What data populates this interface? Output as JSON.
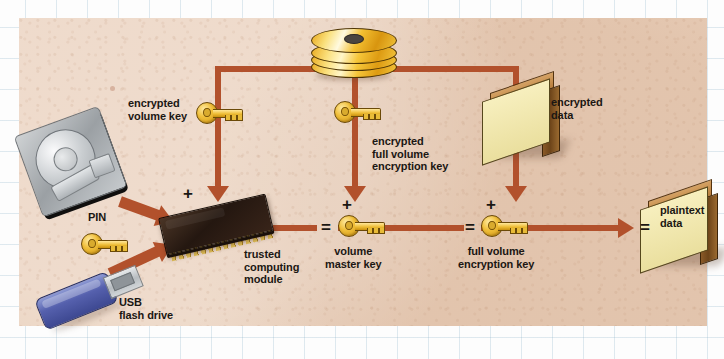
{
  "diagram": {
    "panel_color": "#e9cfba",
    "connector_color": "#b2512c",
    "key_color": "#f0bf3a",
    "labels": {
      "encrypted_volume_key": "encrypted\nvolume key",
      "encrypted_full_volume_encryption_key": "encrypted\nfull volume\nencryption key",
      "encrypted_data": "encrypted\ndata",
      "pin": "PIN",
      "usb_flash_drive": "USB\nflash drive",
      "trusted_computing_module": "trusted\ncomputing\nmodule",
      "volume_master_key": "volume\nmaster key",
      "full_volume_encryption_key": "full volume\nencryption key",
      "plaintext_data": "plaintext\ndata"
    },
    "operators": {
      "plus_chip": "+",
      "plus_vmk": "+",
      "plus_fvek": "+",
      "equals_vmk": "=",
      "equals_fvek": "=",
      "equals_plaintext": "="
    },
    "icons": {
      "hard_disk": "hard-disk-icon",
      "disc_stack": "disc-stack-icon",
      "key_volume": "key-icon",
      "key_fvek": "key-icon",
      "key_pin": "key-icon",
      "key_vmk": "key-icon",
      "key_fullvolume": "key-icon",
      "usb": "usb-flash-drive-icon",
      "chip": "tpm-chip-icon",
      "folder_encrypted": "folder-icon",
      "folder_plaintext": "folder-icon"
    }
  }
}
